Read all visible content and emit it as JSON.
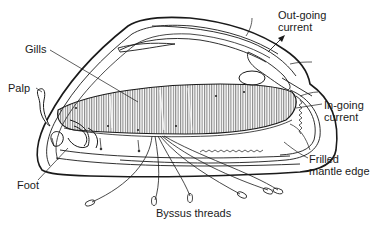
{
  "diagram": {
    "labels": {
      "gills": "Gills",
      "palp": "Palp",
      "foot": "Foot",
      "byssus_threads": "Byssus threads",
      "outgoing_current_line1": "Out-going",
      "outgoing_current_line2": "current",
      "ingoing_current_line1": "In-going",
      "ingoing_current_line2": "current",
      "frilled_mantle_line1": "Frilled",
      "frilled_mantle_line2": "mantle edge"
    },
    "colors": {
      "ink": "#1a1a1a",
      "background": "#ffffff",
      "hatch": "#555555"
    }
  }
}
